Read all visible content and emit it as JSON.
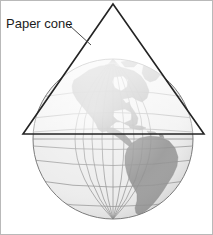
{
  "figure": {
    "width": 213,
    "height": 235,
    "background_color": "#ffffff",
    "border_color": "#b9b9b9"
  },
  "annotations": {
    "cone_label": "Paper cone",
    "leader_line_color": "#4a4a4a"
  },
  "cone": {
    "name": "paper-cone",
    "apex": {
      "x": 112,
      "y": 3
    },
    "base_left": {
      "x": 22,
      "y": 133
    },
    "base_right": {
      "x": 203,
      "y": 133
    },
    "outline_color": "#232323",
    "fill_color": "#ffffff",
    "fill_opacity": 0.55
  },
  "globe": {
    "name": "globe",
    "center": {
      "x": 112,
      "y": 138
    },
    "radius": 80,
    "ocean_color": "#ececec",
    "land_color": "#9a9a9a",
    "graticule_color": "#8d8d8d",
    "outline_color": "#7c7c7c",
    "latitude_interval_degrees": 15,
    "longitude_interval_degrees": 15,
    "landmasses": [
      "greenland",
      "north-america",
      "central-america",
      "caribbean-islands",
      "south-america"
    ]
  }
}
